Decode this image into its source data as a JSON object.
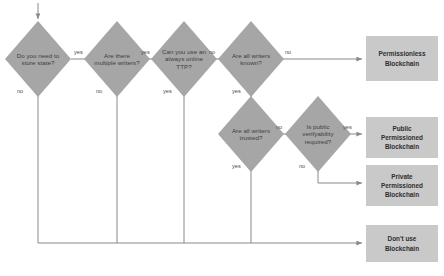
{
  "diagram": {
    "colors": {
      "decision_fill": "#a6a6a6",
      "terminal_fill": "#c9c9c9",
      "line": "#808080",
      "text": "#3d3d3d"
    },
    "decisions": [
      {
        "id": "store-state",
        "text": "Do you need to store state?"
      },
      {
        "id": "multiple-writers",
        "text": "Are there multiple writers?"
      },
      {
        "id": "always-online-ttp",
        "text": "Can you use an always online TTP?"
      },
      {
        "id": "writers-known",
        "text": "Are all writers known?"
      },
      {
        "id": "writers-trusted",
        "text": "Are all writers trusted?"
      },
      {
        "id": "public-verifyability",
        "text": "Is public verifyability required?"
      }
    ],
    "terminals": [
      {
        "id": "permissionless",
        "text": "Permissionless Blockchain"
      },
      {
        "id": "public-permissioned",
        "text": "Public Permissioned Blockchain"
      },
      {
        "id": "private-permissioned",
        "text": "Private Permissioned Blockchain"
      },
      {
        "id": "dont-use",
        "text": "Don't use Blockchain"
      }
    ],
    "edge_labels": {
      "store_state_yes": "yes",
      "store_state_no": "no",
      "multiple_writers_yes": "yes",
      "multiple_writers_no": "no",
      "ttp_no": "no",
      "ttp_yes": "yes",
      "writers_known_no": "no",
      "writers_known_yes": "yes",
      "writers_trusted_no": "no",
      "writers_trusted_yes": "yes",
      "public_verif_yes": "yes",
      "public_verif_no": "no"
    }
  }
}
